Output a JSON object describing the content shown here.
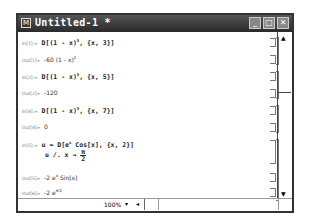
{
  "window": {
    "title": "Untitled-1 *",
    "icon": "notebook-icon",
    "controls": {
      "minimize": "_",
      "maximize": "□",
      "close": "✕"
    }
  },
  "cells": [
    {
      "label": "In[1]:=",
      "type": "input",
      "text": "D[(1 - x)^5, {x, 3}]"
    },
    {
      "label": "Out[1]=",
      "type": "output",
      "text": "-60 (1 - x)^2"
    },
    {
      "label": "In[2]:=",
      "type": "input",
      "text": "D[(1 - x)^5, {x, 5}]"
    },
    {
      "label": "Out[2]=",
      "type": "output",
      "text": "-120"
    },
    {
      "label": "In[4]:=",
      "type": "input",
      "text": "D[(1 - x)^5, {x, 7}]"
    },
    {
      "label": "Out[4]=",
      "type": "output",
      "text": "0"
    },
    {
      "label": "In[5]:=",
      "type": "input",
      "text": "u = D[e^x Cos[x], {x, 2}]",
      "text2": "u /. x → π/2"
    },
    {
      "label": "Out[5]=",
      "type": "output",
      "text": "-2 e^x Sin[x]"
    },
    {
      "label": "Out[6]=",
      "type": "output",
      "text": "-2 e^(π/2)"
    }
  ],
  "display": {
    "in1_pre": "D[(1 - x)",
    "in1_exp": "5",
    "in1_post": ", {x, 3}]",
    "out1_pre": "-60 (1 - x)",
    "out1_exp": "2",
    "in2_pre": "D[(1 - x)",
    "in2_exp": "5",
    "in2_post": ", {x, 5}]",
    "out2": "-120",
    "in4_pre": "D[(1 - x)",
    "in4_exp": "5",
    "in4_post": ", {x, 7}]",
    "out4": "0",
    "in5_pre": "u = D[e",
    "in5_exp": "x",
    "in5_post": " Cos[x], {x, 2}]",
    "in5b_pre": "u /. x → ",
    "in5b_num": "π",
    "in5b_den": "2",
    "out5_pre": "-2 e",
    "out5_exp": "x",
    "out5_post": " Sin[x]",
    "out6_pre": "-2 e",
    "out6_exp": "π/2"
  },
  "statusbar": {
    "zoom": "100%",
    "zoom_dropdown": "▾",
    "scroll_left": "◂"
  },
  "scrollbar": {
    "up": "▲",
    "down": "▼"
  }
}
